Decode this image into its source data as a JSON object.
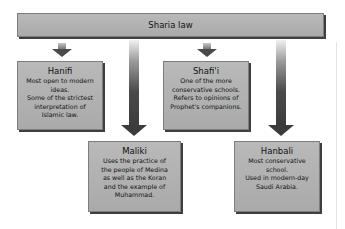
{
  "diagram": {
    "root": {
      "label": "Sharia law"
    },
    "schools": [
      {
        "name": "Hanifi",
        "description": [
          "Most open to modern",
          "ideas.",
          "Some of the strictest",
          "interpretation of",
          "Islamic law."
        ]
      },
      {
        "name": "Shafi'i",
        "description": [
          "One of the more",
          "conservative schools.",
          "Refers to opinions of",
          "Prophet's companions."
        ]
      },
      {
        "name": "Maliki",
        "description": [
          "Uses the practice of",
          "the people of Medina",
          "as well as the Koran",
          "and the example of",
          "Muhammad."
        ]
      },
      {
        "name": "Hanbali",
        "description": [
          "Most conservative",
          "school.",
          "Used in modern-day",
          "Saudi Arabia."
        ]
      }
    ],
    "colors": {
      "box_fill": "#b0b0b0",
      "box_shadow": "#3f3f3f",
      "arrow": "#3c3c3c",
      "background": "#ffffff"
    }
  }
}
